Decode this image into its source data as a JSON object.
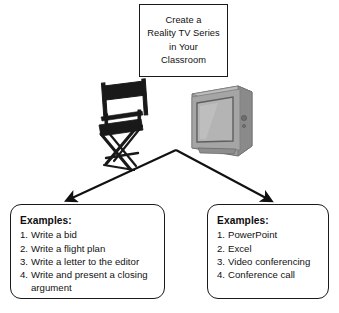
{
  "diagram": {
    "title_box": {
      "text": "Create a\nReality TV Series\nin Your\nClassroom"
    },
    "images": [
      {
        "name": "directors-chair",
        "alt": "Black director's chair"
      },
      {
        "name": "television",
        "alt": "Grey CRT television set"
      }
    ],
    "arrows": [
      {
        "name": "arrow-to-left-examples",
        "direction": "down-left"
      },
      {
        "name": "arrow-to-right-examples",
        "direction": "down-right"
      }
    ],
    "left_box": {
      "heading": "Examples:",
      "items": [
        {
          "num": "1.",
          "text": "Write a bid"
        },
        {
          "num": "2.",
          "text": "Write a flight plan"
        },
        {
          "num": "3.",
          "text": "Write a letter to the editor"
        },
        {
          "num": "4.",
          "text": "Write and present a closing argument"
        }
      ]
    },
    "right_box": {
      "heading": "Examples:",
      "items": [
        {
          "num": "1.",
          "text": "PowerPoint"
        },
        {
          "num": "2.",
          "text": "Excel"
        },
        {
          "num": "3.",
          "text": "Video conferencing"
        },
        {
          "num": "4.",
          "text": "Conference call"
        }
      ]
    },
    "colors": {
      "background": "#ffffff",
      "outline": "#1a1a1a",
      "text": "#111111",
      "chair": "#191919",
      "television": "#9a9a9a"
    }
  }
}
